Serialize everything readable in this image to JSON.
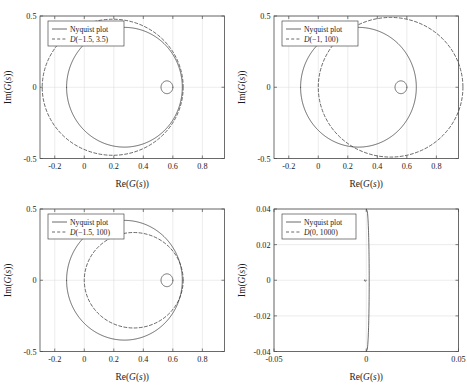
{
  "figure": {
    "kind": "multi-panel-nyquist-figure",
    "panel_count": 4,
    "background": "#ffffff",
    "line_color": "#3a3a3a",
    "grid_color": "#d9d9d9",
    "axis_color": "#4a4a4a"
  },
  "chart_data": [
    {
      "type": "line",
      "id": "panel-1",
      "title": "",
      "xlabel": "Re(G(s))",
      "ylabel": "Im(G(s))",
      "xlim": [
        -0.3,
        0.95
      ],
      "ylim": [
        -0.5,
        0.5
      ],
      "xticks": [
        -0.2,
        0,
        0.2,
        0.4,
        0.6,
        0.8
      ],
      "xticklabels": [
        "-0.2",
        "0",
        "0.2",
        "0.4",
        "0.6",
        "0.8"
      ],
      "yticks": [
        -0.5,
        0,
        0.5
      ],
      "yticklabels": [
        "-0.5",
        "0",
        "0.5"
      ],
      "grid": true,
      "legend_position": "top-left",
      "series": [
        {
          "name": "Nyquist plot",
          "style": "solid",
          "shape": "cardioid",
          "params": {
            "cusp_x": 0.52,
            "x_min": 0.0,
            "x_max": 0.6,
            "y_max": 0.42,
            "lobe_center_x": 0.26,
            "lobe_r": 0.4
          }
        },
        {
          "name": "D(-1.5, 3.5)",
          "style": "dashed",
          "shape": "circle",
          "params": {
            "cx": 0.1925,
            "cy": 0.0,
            "r": 0.4775
          }
        }
      ]
    },
    {
      "type": "line",
      "id": "panel-2",
      "title": "",
      "xlabel": "Re(G(s))",
      "ylabel": "Im(G(s))",
      "xlim": [
        -0.3,
        0.95
      ],
      "ylim": [
        -0.5,
        0.5
      ],
      "xticks": [
        -0.2,
        0,
        0.2,
        0.4,
        0.6,
        0.8
      ],
      "xticklabels": [
        "-0.2",
        "0",
        "0.2",
        "0.4",
        "0.6",
        "0.8"
      ],
      "yticks": [
        -0.5,
        0,
        0.5
      ],
      "yticklabels": [
        "-0.5",
        "0",
        "0.5"
      ],
      "grid": true,
      "legend_position": "top-left",
      "series": [
        {
          "name": "Nyquist plot",
          "style": "solid",
          "shape": "cardioid",
          "params": {
            "cusp_x": 0.52,
            "x_min": 0.0,
            "x_max": 0.6,
            "y_max": 0.42,
            "lobe_center_x": 0.26,
            "lobe_r": 0.4
          }
        },
        {
          "name": "D(-1, 100)",
          "style": "dashed",
          "shape": "circle",
          "params": {
            "cx": 0.49,
            "cy": 0.0,
            "r": 0.49
          }
        }
      ]
    },
    {
      "type": "line",
      "id": "panel-3",
      "title": "",
      "xlabel": "Re(G(s))",
      "ylabel": "Im(G(s))",
      "xlim": [
        -0.3,
        0.95
      ],
      "ylim": [
        -0.5,
        0.5
      ],
      "xticks": [
        -0.2,
        0,
        0.2,
        0.4,
        0.6,
        0.8
      ],
      "xticklabels": [
        "-0.2",
        "0",
        "0.2",
        "0.4",
        "0.6",
        "0.8"
      ],
      "yticks": [
        -0.5,
        0,
        0.5
      ],
      "yticklabels": [
        "-0.5",
        "0",
        "0.5"
      ],
      "grid": true,
      "legend_position": "top-left",
      "series": [
        {
          "name": "Nyquist plot",
          "style": "solid",
          "shape": "cardioid",
          "params": {
            "cusp_x": 0.52,
            "x_min": 0.0,
            "x_max": 0.6,
            "y_max": 0.42,
            "lobe_center_x": 0.26,
            "lobe_r": 0.4
          }
        },
        {
          "name": "D(-1.5, 100)",
          "style": "dashed",
          "shape": "circle",
          "params": {
            "cx": 0.335,
            "cy": 0.0,
            "r": 0.335
          }
        }
      ]
    },
    {
      "type": "line",
      "id": "panel-4",
      "title": "",
      "xlabel": "Re(G(s))",
      "ylabel": "Im(G(s))",
      "xlim": [
        -0.05,
        0.05
      ],
      "ylim": [
        -0.04,
        0.04
      ],
      "xticks": [
        -0.05,
        0,
        0.05
      ],
      "xticklabels": [
        "-0.05",
        "0",
        "0.05"
      ],
      "yticks": [
        -0.04,
        -0.02,
        0,
        0.02,
        0.04
      ],
      "yticklabels": [
        "-0.04",
        "-0.02",
        "0",
        "0.02",
        "0.04"
      ],
      "grid": true,
      "legend_position": "top-left",
      "series": [
        {
          "name": "Nyquist plot",
          "style": "solid",
          "shape": "sliver",
          "params": {
            "cusp_x": 0.0016,
            "x_min": 0.0,
            "x_max": 0.0016,
            "y_max": 0.04
          }
        },
        {
          "name": "D(0, 1000)",
          "style": "dashed",
          "shape": "circle",
          "params": {
            "cx": -0.0005,
            "cy": 0.0,
            "r": 0.0005
          }
        }
      ]
    }
  ],
  "legends": {
    "nyquist_label": "Nyquist plot",
    "panel1_disc": "D(−1.5, 3.5)",
    "panel2_disc": "D(−1, 100)",
    "panel3_disc": "D(−1.5, 100)",
    "panel4_disc": "D(0, 1000)"
  },
  "axis_labels": {
    "x": "Re(G(s))",
    "y": "Im(G(s))"
  }
}
